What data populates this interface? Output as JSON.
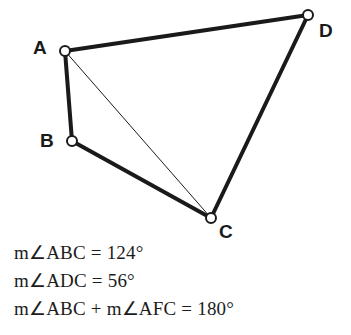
{
  "figure": {
    "type": "geometry-diagram",
    "background_color": "#ffffff",
    "stroke_color": "#1a1a1a",
    "vertex_fill_color": "#ffffff",
    "thick_stroke_width": 4,
    "thin_stroke_width": 1,
    "vertex_radius": 5,
    "vertices": [
      {
        "name": "A",
        "x": 65,
        "y": 51,
        "label": "A",
        "label_x": 33,
        "label_y": 38
      },
      {
        "name": "B",
        "x": 72,
        "y": 141,
        "label": "B",
        "label_x": 40,
        "label_y": 131
      },
      {
        "name": "C",
        "x": 211,
        "y": 218,
        "label": "C",
        "label_x": 219,
        "label_y": 222
      },
      {
        "name": "D",
        "x": 308,
        "y": 15,
        "label": "D",
        "label_x": 319,
        "label_y": 21
      }
    ],
    "edges": [
      {
        "name": "segment-AD",
        "from": "A",
        "to": "D",
        "weight": "thick"
      },
      {
        "name": "segment-AB",
        "from": "A",
        "to": "B",
        "weight": "thick"
      },
      {
        "name": "segment-BC",
        "from": "B",
        "to": "C",
        "weight": "thick"
      },
      {
        "name": "segment-CD",
        "from": "C",
        "to": "D",
        "weight": "thick"
      },
      {
        "name": "diagonal-AC",
        "from": "A",
        "to": "C",
        "weight": "thin"
      }
    ]
  },
  "statements": [
    {
      "text": "m∠ABC = 124°"
    },
    {
      "text": "m∠ADC = 56°"
    },
    {
      "text": "m∠ABC + m∠AFC = 180°"
    }
  ]
}
